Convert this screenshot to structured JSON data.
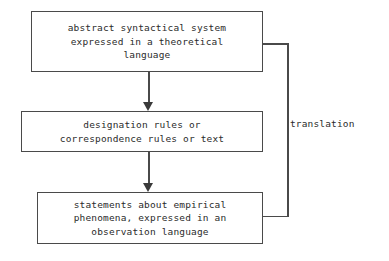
{
  "diagram": {
    "background_color": "#ffffff",
    "line_color": "#4a4a4a",
    "text_color": "#2b2b2b",
    "nodes": [
      {
        "id": "abstract-system",
        "text": "abstract syntactical system\nexpressed in a theoretical\nlanguage"
      },
      {
        "id": "designation-rules",
        "text": "designation rules or\ncorrespondence rules or text"
      },
      {
        "id": "statements-empirical",
        "text": "statements about empirical\nphenomena, expressed in an\nobservation language"
      }
    ],
    "connectors": [
      {
        "id": "arrow-1",
        "from": "abstract-system",
        "to": "designation-rules",
        "style": "arrow-down"
      },
      {
        "id": "arrow-2",
        "from": "designation-rules",
        "to": "statements-empirical",
        "style": "arrow-down"
      }
    ],
    "bracket": {
      "label": "translation",
      "spans_from": "abstract-system",
      "spans_to": "statements-empirical"
    }
  }
}
